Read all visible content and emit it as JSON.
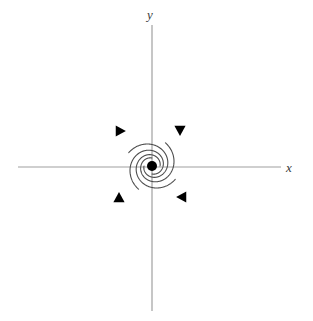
{
  "figure": {
    "width": 313,
    "height": 321,
    "background_color": "#ffffff"
  },
  "axes": {
    "x_label": "x",
    "y_label": "y",
    "color": "#a0a0a0",
    "line_width": 1.2,
    "x_axis": {
      "x1": 18,
      "y1": 167,
      "x2": 281,
      "y2": 167
    },
    "y_axis": {
      "x1": 152,
      "y1": 25,
      "x2": 152,
      "y2": 311
    }
  },
  "equilibrium": {
    "label": "equilibrium-point",
    "x": 152,
    "y": 166,
    "radius": 5,
    "color": "#000000"
  },
  "curves": {
    "color": "#4d4d4d",
    "line_width": 1.1,
    "count": 4
  },
  "arrowheads": {
    "color": "#000000",
    "count": 4,
    "items": [
      {
        "name": "arrowhead-down-right-arm",
        "x": 180,
        "y": 130,
        "direction": "down"
      },
      {
        "name": "arrowhead-right-upper-left-arm",
        "x": 120,
        "y": 131,
        "direction": "right"
      },
      {
        "name": "arrowhead-left-lower-right-arm",
        "x": 182,
        "y": 197,
        "direction": "left"
      },
      {
        "name": "arrowhead-up-lower-left-arm",
        "x": 119,
        "y": 198,
        "direction": "up"
      }
    ]
  },
  "chart_data": {
    "type": "line",
    "xlabel": "x",
    "ylabel": "y",
    "grid": false,
    "legend": "none",
    "xlim": [
      -152,
      161
    ],
    "ylim": [
      -154,
      167
    ],
    "annotations": [
      "Stable spiral / focus: all trajectories spiral inward to the origin",
      "Flow direction is clockwise inward",
      "Four representative trajectories shown, rotated 90 degrees apart"
    ],
    "equilibrium_point": {
      "x": 0,
      "y": 0,
      "type": "stable spiral",
      "marker": "filled circle"
    },
    "spiral_model": {
      "form": "logarithmic spiral r = r0 * exp(b * theta)",
      "r0": 8,
      "b": 0.21,
      "theta_start_deg": 0,
      "theta_end_deg": 330,
      "direction": "clockwise inward"
    },
    "series": [
      {
        "name": "trajectory-1",
        "rotation_deg": 0,
        "start_point": [
          -55,
          134
        ],
        "end_point": [
          0,
          0
        ],
        "arrowhead_at": [
          28,
          37
        ],
        "arrowhead_direction": "down"
      },
      {
        "name": "trajectory-2",
        "rotation_deg": 90,
        "start_point": [
          -134,
          -55
        ],
        "end_point": [
          0,
          0
        ],
        "arrowhead_at": [
          -32,
          36
        ],
        "arrowhead_direction": "right"
      },
      {
        "name": "trajectory-3",
        "rotation_deg": 180,
        "start_point": [
          55,
          -134
        ],
        "end_point": [
          0,
          0
        ],
        "arrowhead_at": [
          30,
          -31
        ],
        "arrowhead_direction": "left"
      },
      {
        "name": "trajectory-4",
        "rotation_deg": 270,
        "start_point": [
          134,
          55
        ],
        "end_point": [
          0,
          0
        ],
        "arrowhead_at": [
          -33,
          -32
        ],
        "arrowhead_direction": "up"
      }
    ]
  }
}
